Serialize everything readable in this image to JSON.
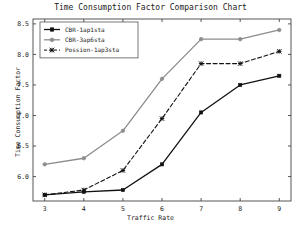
{
  "chart_data": {
    "type": "line",
    "title": "Time Consumption Factor Comparison Chart",
    "xlabel": "Traffic Rate",
    "ylabel": "Time Consumption Factor",
    "x": [
      3,
      4,
      5,
      6,
      7,
      8,
      9
    ],
    "xtick_labels": [
      "3",
      "4",
      "5",
      "6",
      "7",
      "8",
      "9"
    ],
    "ytick_labels": [
      "6.0",
      "6.5",
      "7.0",
      "7.5",
      "8.0",
      "8.5"
    ],
    "yticks": [
      6.0,
      6.5,
      7.0,
      7.5,
      8.0,
      8.5
    ],
    "xlim": [
      2.7,
      9.3
    ],
    "ylim": [
      5.6,
      8.58
    ],
    "grid": false,
    "legend_position": "top-left",
    "series": [
      {
        "name": "CBR-1ap1sta",
        "values": [
          5.7,
          5.75,
          5.78,
          6.2,
          7.05,
          7.5,
          7.65
        ],
        "color": "#111111",
        "marker": "square-filled",
        "linestyle": "solid"
      },
      {
        "name": "CBR-3ap6sta",
        "values": [
          6.2,
          6.3,
          6.75,
          7.6,
          8.25,
          8.25,
          8.4
        ],
        "color": "#8c8c8c",
        "marker": "circle-filled",
        "linestyle": "solid"
      },
      {
        "name": "Possion-1ap3sta",
        "values": [
          5.7,
          5.78,
          6.1,
          6.95,
          7.85,
          7.85,
          8.05
        ],
        "color": "#111111",
        "marker": "x",
        "linestyle": "dashed"
      }
    ]
  }
}
